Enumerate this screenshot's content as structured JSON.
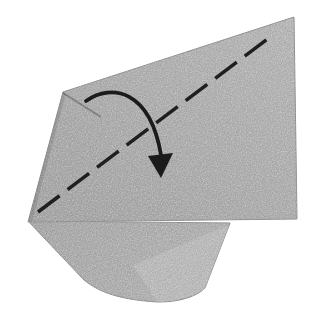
{
  "canvas": {
    "width": "309",
    "height": "323",
    "background": "#ffffff"
  },
  "paper": {
    "texture": "grainy-woven-gray-paper",
    "colors": {
      "base": "#adadad",
      "light": "#b6b6b6",
      "lighter": "#bcbcbc",
      "dark": "#a0a0a0",
      "flap_dark": "#a4a4a4",
      "flap_light": "#b0b0b0",
      "edge": "#8d8d8d",
      "shadow": "#2e2e2e",
      "inner_shade": "rgba(0,0,0,0.10)",
      "crease": "rgba(40,40,40,0.35)",
      "grain_dark": "0 0 0 0 0.25  0 0 0 0 0.25  0 0 0 0 0.25  0.9 0.9 0.9 0 -0.9",
      "grain_light": "0 0 0 0 0.96  0 0 0 0 0.96  0 0 0 0 0.96  0.9 0.9 0.9 0 -1.1"
    },
    "top_layer": {
      "points": "294,17 297,219 28,222 63,92"
    },
    "bottom_flap": {
      "path": "M 28 221 L 84 280 C 100 293 122 300 158 302 C 183 302 198 295 205 288 L 230 223 Z",
      "highlight_path": "M 133 265 L 229 225 L 205 288 C 197 295 179 301 157 302 Z"
    },
    "corner_crease": {
      "path": "M 63 93 L 101 117"
    },
    "left_edge_shade": {
      "path": "M 63 93 L 29 221"
    },
    "layer_shadow": {
      "path": "M 29 221.5 L 232 221.5"
    }
  },
  "fold_annotation": {
    "fold_line": {
      "path": "M 38 212 L 274 34",
      "dash": "27 10",
      "color": "#1f1f1f",
      "width": "3.5"
    },
    "arrow": {
      "arc_path": "M 86 101 C 112 83 150 90 161 155",
      "head_points": "148,156 173,153 161,178",
      "color": "#1b1b1b",
      "width": "3.8"
    }
  }
}
